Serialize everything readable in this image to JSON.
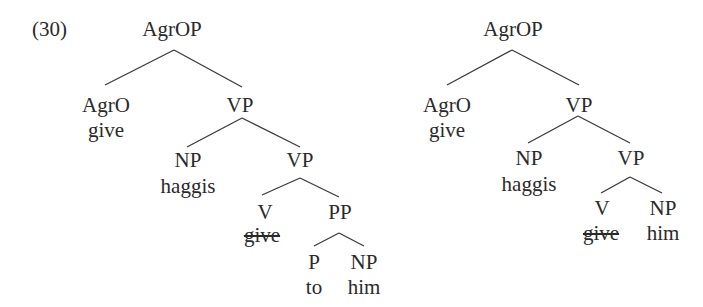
{
  "example_number": "(30)",
  "trees": [
    {
      "id": "left",
      "nodes": [
        {
          "label": "AgrOP",
          "x": 172,
          "y": 18
        },
        {
          "label": "AgrO",
          "x": 106,
          "y": 94
        },
        {
          "label": "give",
          "x": 106,
          "y": 119,
          "struck": false
        },
        {
          "label": "VP",
          "x": 240,
          "y": 94
        },
        {
          "label": "NP",
          "x": 188,
          "y": 149
        },
        {
          "label": "haggis",
          "x": 188,
          "y": 175
        },
        {
          "label": "VP",
          "x": 300,
          "y": 149
        },
        {
          "label": "V",
          "x": 265,
          "y": 201
        },
        {
          "label": "give",
          "x": 262,
          "y": 224,
          "struck": true
        },
        {
          "label": "PP",
          "x": 340,
          "y": 201
        },
        {
          "label": "P",
          "x": 314,
          "y": 251
        },
        {
          "label": "to",
          "x": 314,
          "y": 276
        },
        {
          "label": "NP",
          "x": 364,
          "y": 251
        },
        {
          "label": "him",
          "x": 364,
          "y": 276
        }
      ],
      "edges": [
        [
          174,
          50,
          105,
          85
        ],
        [
          174,
          50,
          242,
          87
        ],
        [
          242,
          118,
          187,
          147
        ],
        [
          242,
          118,
          300,
          147
        ],
        [
          300,
          178,
          262,
          195
        ],
        [
          300,
          178,
          339,
          197
        ],
        [
          339,
          233,
          314,
          246
        ],
        [
          339,
          233,
          364,
          246
        ]
      ]
    },
    {
      "id": "right",
      "nodes": [
        {
          "label": "AgrOP",
          "x": 513,
          "y": 18
        },
        {
          "label": "AgrO",
          "x": 447,
          "y": 94
        },
        {
          "label": "give",
          "x": 447,
          "y": 119,
          "struck": false
        },
        {
          "label": "VP",
          "x": 579,
          "y": 94
        },
        {
          "label": "NP",
          "x": 529,
          "y": 147
        },
        {
          "label": "haggis",
          "x": 529,
          "y": 173
        },
        {
          "label": "VP",
          "x": 631,
          "y": 147
        },
        {
          "label": "V",
          "x": 602,
          "y": 197
        },
        {
          "label": "give",
          "x": 601,
          "y": 222,
          "struck": true
        },
        {
          "label": "NP",
          "x": 663,
          "y": 197
        },
        {
          "label": "him",
          "x": 663,
          "y": 222
        }
      ],
      "edges": [
        [
          512,
          50,
          447,
          85
        ],
        [
          512,
          50,
          579,
          85
        ],
        [
          578,
          116,
          528,
          143
        ],
        [
          578,
          116,
          630,
          143
        ],
        [
          630,
          177,
          601,
          193
        ],
        [
          630,
          177,
          662,
          193
        ]
      ]
    }
  ]
}
